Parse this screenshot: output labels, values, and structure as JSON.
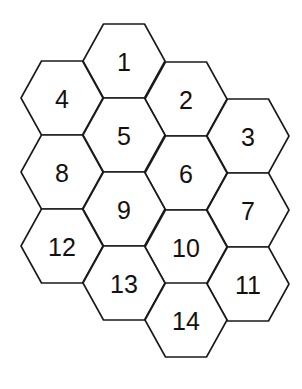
{
  "diagram": {
    "type": "hexagonal-grid",
    "hex_half_width": 41,
    "hex_half_height": 37,
    "line_color": "#1a1a1a",
    "text_color": "#111111",
    "cells": [
      {
        "label": "1",
        "cx": 124,
        "cy": 61
      },
      {
        "label": "2",
        "cx": 186,
        "cy": 99
      },
      {
        "label": "3",
        "cx": 248,
        "cy": 136
      },
      {
        "label": "4",
        "cx": 62,
        "cy": 98
      },
      {
        "label": "5",
        "cx": 124,
        "cy": 135
      },
      {
        "label": "6",
        "cx": 186,
        "cy": 173
      },
      {
        "label": "7",
        "cx": 248,
        "cy": 210
      },
      {
        "label": "8",
        "cx": 62,
        "cy": 172
      },
      {
        "label": "9",
        "cx": 124,
        "cy": 209
      },
      {
        "label": "10",
        "cx": 186,
        "cy": 247
      },
      {
        "label": "11",
        "cx": 248,
        "cy": 284
      },
      {
        "label": "12",
        "cx": 62,
        "cy": 246
      },
      {
        "label": "13",
        "cx": 124,
        "cy": 283
      },
      {
        "label": "14",
        "cx": 186,
        "cy": 320
      }
    ]
  }
}
